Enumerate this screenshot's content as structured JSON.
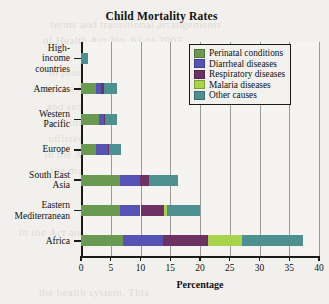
{
  "chart_data": {
    "type": "bar",
    "orientation": "horizontal",
    "stacked": true,
    "title": "Child Mortality Rates",
    "xlabel": "Percentage",
    "ylabel": "",
    "xlim": [
      0,
      40
    ],
    "xticks": [
      0,
      5,
      10,
      15,
      20,
      25,
      30,
      35,
      40
    ],
    "grid": "vertical",
    "legend_position": "top-right",
    "categories": [
      "High-income countries",
      "Americas",
      "Western Pacific",
      "Europe",
      "South East Asia",
      "Eastern Mediterranean",
      "Africa"
    ],
    "series": [
      {
        "name": "Perinatal conditions",
        "color": "#6a9a52",
        "values": [
          0.0,
          2.5,
          3.0,
          2.5,
          6.5,
          6.5,
          7.0
        ]
      },
      {
        "name": "Diarrheal diseases",
        "color": "#5753b4",
        "values": [
          0.0,
          0.9,
          0.8,
          2.0,
          3.4,
          3.5,
          6.8
        ]
      },
      {
        "name": "Respiratory diseases",
        "color": "#6d3263",
        "values": [
          0.0,
          0.5,
          0.2,
          0.2,
          1.5,
          4.0,
          7.5
        ]
      },
      {
        "name": "Malaria diseases",
        "color": "#a9d34b",
        "values": [
          0.0,
          0.0,
          0.0,
          0.0,
          0.1,
          0.5,
          5.8
        ]
      },
      {
        "name": "Other causes",
        "color": "#4d9090",
        "values": [
          1.1,
          2.1,
          2.0,
          2.1,
          4.8,
          5.5,
          10.2
        ]
      }
    ],
    "totals": [
      1.1,
      6.0,
      6.0,
      6.8,
      16.3,
      20.0,
      37.3
    ]
  },
  "legend": {
    "items": [
      {
        "label": "Perinatal conditions",
        "color": "#6a9a52"
      },
      {
        "label": "Diarrheal diseases",
        "color": "#5753b4"
      },
      {
        "label": "Respiratory diseases",
        "color": "#6d3263"
      },
      {
        "label": "Malaria diseases",
        "color": "#a9d34b"
      },
      {
        "label": "Other causes",
        "color": "#4d9090"
      }
    ]
  },
  "background_text": [
    "terms and transitional arrangements",
    "of Health Act No. 61 of 2003",
    "to proceed with the process",
    "by the Act. Since then, the",
    "and sensible regulations were",
    "the clinic serves as a platform",
    "utilized in implementing certain",
    "in the Act. Chapter 9 provides",
    "the management of human",
    "in the Act and of the",
    "the health system. This"
  ]
}
